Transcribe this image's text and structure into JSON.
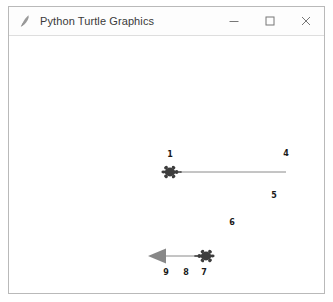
{
  "window": {
    "title": "Python Turtle Graphics",
    "icon": "python-turtle-feather-icon",
    "controls": {
      "minimize": "minimize-icon",
      "maximize": "maximize-icon",
      "close": "close-icon"
    }
  },
  "canvas": {
    "background": "#ffffff",
    "line_color": "#8a8a8a",
    "turtle_color": "#3d3d3d",
    "arrow_color": "#888888",
    "label_color": "#1a1a1a",
    "turtles": [
      {
        "name": "turtle-upper",
        "shape": "turtle",
        "heading": "east",
        "x": 172,
        "y": 172,
        "color": "#3d3d3d"
      },
      {
        "name": "turtle-lower",
        "shape": "turtle",
        "heading": "west",
        "x": 204,
        "y": 256,
        "color": "#3d3d3d"
      },
      {
        "name": "turtle-arrow-lower-left",
        "shape": "classic-arrow",
        "heading": "west",
        "x": 158,
        "y": 256,
        "color": "#888888"
      }
    ],
    "lines": [
      {
        "name": "line-upper",
        "x1": 180,
        "y1": 172,
        "x2": 286,
        "y2": 172
      },
      {
        "name": "line-lower",
        "x1": 162,
        "y1": 256,
        "x2": 200,
        "y2": 256
      }
    ],
    "labels": [
      {
        "name": "label-1",
        "text": "1",
        "x": 170,
        "y": 155
      },
      {
        "name": "label-4",
        "text": "4",
        "x": 286,
        "y": 154
      },
      {
        "name": "label-5",
        "text": "5",
        "x": 274,
        "y": 196
      },
      {
        "name": "label-6",
        "text": "6",
        "x": 232,
        "y": 223
      },
      {
        "name": "label-9",
        "text": "9",
        "x": 166,
        "y": 273
      },
      {
        "name": "label-8",
        "text": "8",
        "x": 186,
        "y": 273
      },
      {
        "name": "label-7",
        "text": "7",
        "x": 204,
        "y": 273
      }
    ]
  }
}
